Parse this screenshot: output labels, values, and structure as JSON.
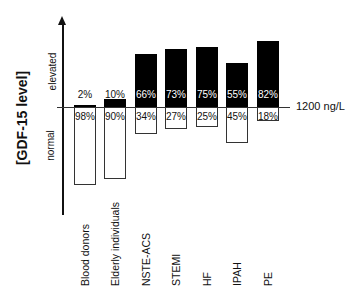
{
  "chart_data": {
    "type": "bar",
    "title": "",
    "ylabel": "[GDF-15 level]",
    "ylabel_regions": {
      "upper": "elevated",
      "lower": "normal"
    },
    "threshold_label": "1200 ng/L",
    "categories": [
      "Blood donors",
      "Elderly individuals",
      "NSTE-ACS",
      "STEMI",
      "HF",
      "IPAH",
      "PE"
    ],
    "series": [
      {
        "name": "elevated",
        "color": "#000000",
        "values": [
          2,
          10,
          66,
          73,
          75,
          55,
          82
        ]
      },
      {
        "name": "normal",
        "color": "#ffffff",
        "values": [
          98,
          90,
          34,
          27,
          25,
          45,
          18
        ]
      }
    ],
    "labels_elevated": [
      "2%",
      "10%",
      "66%",
      "73%",
      "75%",
      "55%",
      "82%"
    ],
    "labels_normal": [
      "98%",
      "90%",
      "34%",
      "27%",
      "25%",
      "45%",
      "18%"
    ],
    "grid": false,
    "legend": "none"
  }
}
